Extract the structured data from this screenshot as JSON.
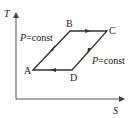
{
  "diagram": {
    "axes": {
      "y_label": "T",
      "x_label": "S"
    },
    "points": {
      "A": "A",
      "B": "B",
      "C": "C",
      "D": "D"
    },
    "annotations": {
      "left_process": {
        "var": "P",
        "rest": "=const"
      },
      "right_process": {
        "var": "P",
        "rest": "=const"
      }
    },
    "cycle_order": [
      "A",
      "B",
      "C",
      "D",
      "A"
    ],
    "colors": {
      "line": "#333333",
      "background": "#ffffff"
    }
  }
}
